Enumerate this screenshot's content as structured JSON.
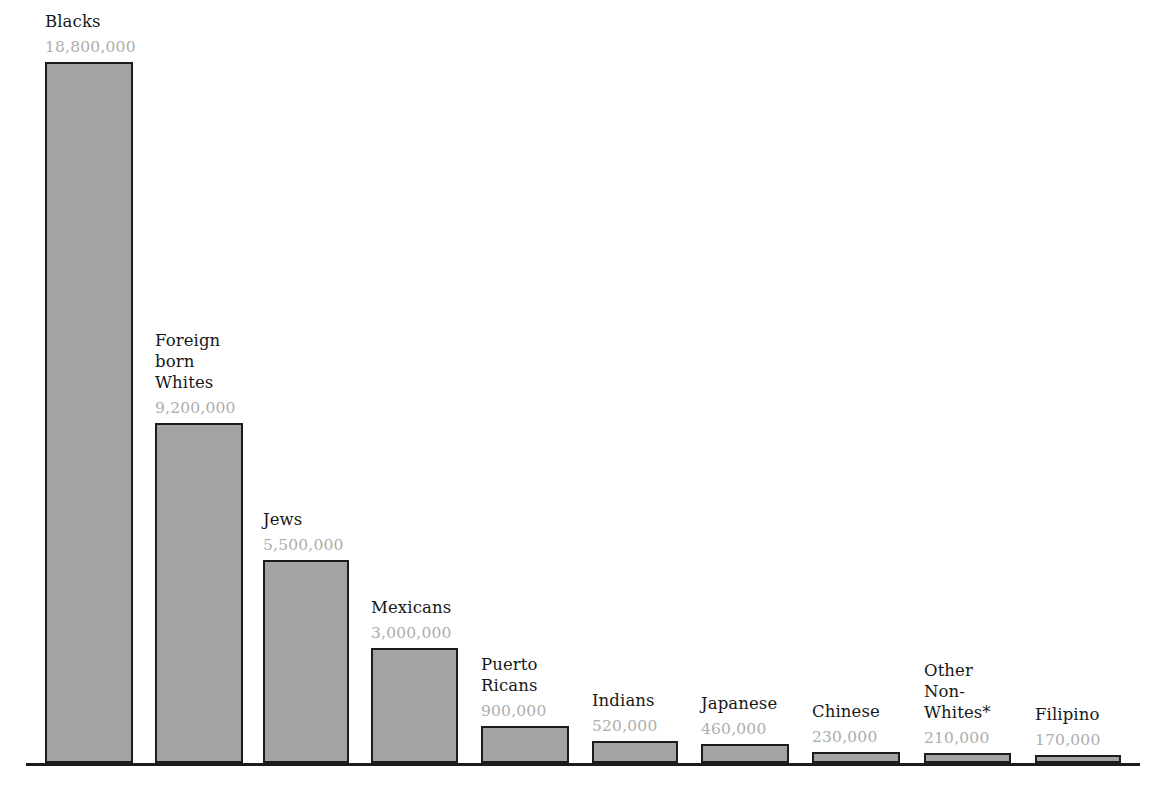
{
  "chart_data": {
    "type": "bar",
    "title": "",
    "subtitle": "",
    "xlabel": "",
    "ylabel": "",
    "grid": false,
    "legend": "none",
    "ylim": [
      0,
      18800000
    ],
    "categories": [
      "Blacks",
      "Foreign\nborn\nWhites",
      "Jews",
      "Mexicans",
      "Puerto\nRicans",
      "Indians",
      "Japanese",
      "Chinese",
      "Other\nNon-\nWhites*",
      "Filipino"
    ],
    "values": [
      18800000,
      9200000,
      5500000,
      3000000,
      900000,
      520000,
      460000,
      230000,
      210000,
      170000
    ],
    "value_labels": [
      "18,800,000",
      "9,200,000",
      "5,500,000",
      "3,000,000",
      "900,000",
      "520,000",
      "460,000",
      "230,000",
      "210,000",
      "170,000"
    ],
    "colors": {
      "bar_fill": "#a3a3a3",
      "bar_stroke": "#1c1c1c",
      "value_label": "#adadad",
      "category_label": "#181818",
      "background": "#ffffff",
      "axis": "#1c1c1c"
    },
    "bars": [
      {
        "name": "Blacks",
        "label": "Blacks",
        "value": 18800000,
        "value_label": "18,800,000",
        "left": 45,
        "width": 88,
        "top": 62
      },
      {
        "name": "Foreign born Whites",
        "label": "Foreign\nborn\nWhites",
        "value": 9200000,
        "value_label": "9,200,000",
        "left": 155,
        "width": 88,
        "top": 423
      },
      {
        "name": "Jews",
        "label": "Jews",
        "value": 5500000,
        "value_label": "5,500,000",
        "left": 263,
        "width": 86,
        "top": 560
      },
      {
        "name": "Mexicans",
        "label": "Mexicans",
        "value": 3000000,
        "value_label": "3,000,000",
        "left": 371,
        "width": 87,
        "top": 648
      },
      {
        "name": "Puerto Ricans",
        "label": "Puerto\nRicans",
        "value": 900000,
        "value_label": "900,000",
        "left": 481,
        "width": 88,
        "top": 726
      },
      {
        "name": "Indians",
        "label": "Indians",
        "value": 520000,
        "value_label": "520,000",
        "left": 592,
        "width": 86,
        "top": 741
      },
      {
        "name": "Japanese",
        "label": "Japanese",
        "value": 460000,
        "value_label": "460,000",
        "left": 701,
        "width": 88,
        "top": 744
      },
      {
        "name": "Chinese",
        "label": "Chinese",
        "value": 230000,
        "value_label": "230,000",
        "left": 812,
        "width": 88,
        "top": 752
      },
      {
        "name": "Other Non-Whites",
        "label": "Other\nNon-\nWhites*",
        "value": 210000,
        "value_label": "210,000",
        "left": 924,
        "width": 87,
        "top": 753
      },
      {
        "name": "Filipino",
        "label": "Filipino",
        "value": 170000,
        "value_label": "170,000",
        "left": 1035,
        "width": 86,
        "top": 755
      }
    ]
  }
}
